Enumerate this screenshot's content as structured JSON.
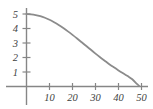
{
  "chart_data": {
    "type": "line",
    "title": "",
    "subtitle": "",
    "xlabel": "",
    "ylabel": "",
    "xlim": [
      -2,
      53
    ],
    "ylim": [
      0,
      5.4
    ],
    "grid": false,
    "legend": null,
    "curve_color": "#8b8b8b",
    "axis_color": "#868686",
    "label_color": "#3f3f3f",
    "background_color": "#ffffff",
    "x_ticks": [
      10,
      20,
      30,
      40,
      50
    ],
    "x_tick_labels": [
      "10",
      "20",
      "30",
      "40",
      "50"
    ],
    "y_ticks": [
      1,
      2,
      3,
      4,
      5
    ],
    "y_tick_labels": [
      "1",
      "2",
      "3",
      "4",
      "5"
    ],
    "series": [
      {
        "name": "decay",
        "x": [
          0,
          2,
          4,
          6,
          8,
          10,
          12,
          14,
          16,
          18,
          20,
          22,
          24,
          26,
          28,
          30,
          32,
          34,
          36,
          38,
          40,
          42,
          44,
          46,
          48,
          49
        ],
        "y": [
          5.0,
          4.98,
          4.93,
          4.85,
          4.74,
          4.6,
          4.43,
          4.24,
          4.03,
          3.8,
          3.56,
          3.31,
          3.05,
          2.79,
          2.53,
          2.27,
          2.02,
          1.78,
          1.54,
          1.32,
          1.11,
          0.91,
          0.72,
          0.5,
          0.18,
          0.04
        ]
      }
    ]
  },
  "axes": {
    "y_axis_name": "vertical-axis",
    "x_axis_name": "horizontal-axis"
  }
}
